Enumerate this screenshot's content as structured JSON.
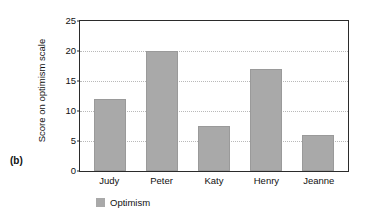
{
  "panel": {
    "label": "(b)"
  },
  "chart_data": {
    "type": "bar",
    "title": "",
    "xlabel": "",
    "ylabel": "Score on optimism scale",
    "categories": [
      "Judy",
      "Peter",
      "Katy",
      "Henry",
      "Jeanne"
    ],
    "series": [
      {
        "name": "Optimism",
        "values": [
          12,
          20,
          7.5,
          17,
          6
        ],
        "color": "#a9a9a9"
      }
    ],
    "ylim": [
      0,
      25
    ],
    "yticks": [
      0,
      5,
      10,
      15,
      20,
      25
    ],
    "ytick_labels": [
      "0",
      "5",
      "10",
      "15",
      "20",
      "25"
    ],
    "grid": "horizontal-dotted",
    "legend": {
      "position": "bottom-left",
      "entries": [
        {
          "label": "Optimism",
          "color": "#a9a9a9"
        }
      ]
    }
  },
  "colors": {
    "bar": "#a9a9a9",
    "axis": "#2b2b2b",
    "grid": "#b9b9b9",
    "text": "#111111",
    "background": "#ffffff"
  }
}
